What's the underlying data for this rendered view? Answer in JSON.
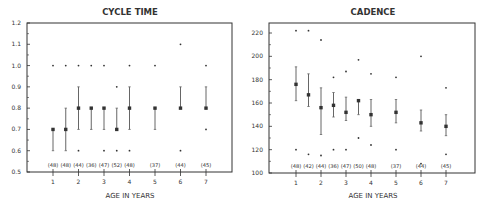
{
  "chart_data": [
    {
      "type": "scatter",
      "subtype": "error-bar",
      "title": "CYCLE TIME",
      "xlabel": "AGE IN YEARS",
      "ylabel": "",
      "ylim": [
        0.5,
        1.2
      ],
      "yticks": [
        0.5,
        0.6,
        0.7,
        0.8,
        0.9,
        1.0,
        1.1,
        1.2
      ],
      "ytick_labels": [
        "0.5",
        "0.6",
        "0.7",
        "0.8",
        "0.9",
        "1.0",
        "1.1",
        "1.2"
      ],
      "xticks": [
        1,
        2,
        3,
        4,
        5,
        6,
        7
      ],
      "grid": false,
      "points": [
        {
          "age": 1,
          "n": "(48)",
          "mean": 0.7,
          "low": 0.6,
          "high": 0.7,
          "outliers": [
            1.0
          ]
        },
        {
          "age": 1.5,
          "n": "(48)",
          "mean": 0.7,
          "low": 0.6,
          "high": 0.8,
          "outliers": [
            1.0
          ]
        },
        {
          "age": 2,
          "n": "(44)",
          "mean": 0.8,
          "low": 0.7,
          "high": 0.9,
          "outliers": [
            1.0,
            0.6
          ]
        },
        {
          "age": 2.5,
          "n": "(36)",
          "mean": 0.8,
          "low": 0.7,
          "high": 0.8,
          "outliers": [
            1.0
          ]
        },
        {
          "age": 3,
          "n": "(47)",
          "mean": 0.8,
          "low": 0.7,
          "high": 0.8,
          "outliers": [
            1.0,
            0.6
          ]
        },
        {
          "age": 3.5,
          "n": "(52)",
          "mean": 0.7,
          "low": 0.7,
          "high": 0.8,
          "outliers": [
            0.9,
            0.6
          ]
        },
        {
          "age": 4,
          "n": "(48)",
          "mean": 0.8,
          "low": 0.7,
          "high": 0.9,
          "outliers": [
            1.0,
            0.6
          ]
        },
        {
          "age": 5,
          "n": "(37)",
          "mean": 0.8,
          "low": 0.7,
          "high": 0.8,
          "outliers": [
            1.0
          ]
        },
        {
          "age": 6,
          "n": "(44)",
          "mean": 0.8,
          "low": 0.8,
          "high": 0.9,
          "outliers": [
            1.1,
            0.6
          ]
        },
        {
          "age": 7,
          "n": "(45)",
          "mean": 0.8,
          "low": 0.8,
          "high": 0.9,
          "outliers": [
            1.0,
            0.7
          ]
        }
      ]
    },
    {
      "type": "scatter",
      "subtype": "error-bar",
      "title": "CADENCE",
      "xlabel": "AGE IN YEARS",
      "ylabel": "",
      "ylim": [
        100,
        220
      ],
      "yticks": [
        100,
        120,
        140,
        160,
        180,
        200,
        220
      ],
      "ytick_labels": [
        "100",
        "120",
        "140",
        "160",
        "180",
        "200",
        "220"
      ],
      "xticks": [
        1,
        2,
        3,
        4,
        5,
        6,
        7
      ],
      "grid": false,
      "points": [
        {
          "age": 1,
          "n": "(48)",
          "mean": 176,
          "low": 162,
          "high": 191,
          "outliers": [
            222,
            120
          ]
        },
        {
          "age": 1.5,
          "n": "(42)",
          "mean": 167,
          "low": 157,
          "high": 185,
          "outliers": [
            222,
            116
          ]
        },
        {
          "age": 2,
          "n": "(44)",
          "mean": 156,
          "low": 133,
          "high": 173,
          "outliers": [
            214,
            115
          ]
        },
        {
          "age": 2.5,
          "n": "(36)",
          "mean": 158,
          "low": 148,
          "high": 169,
          "outliers": [
            182,
            120
          ]
        },
        {
          "age": 3,
          "n": "(47)",
          "mean": 152,
          "low": 145,
          "high": 165,
          "outliers": [
            187,
            120
          ]
        },
        {
          "age": 3.5,
          "n": "(50)",
          "mean": 162,
          "low": 150,
          "high": 163,
          "outliers": [
            197,
            130
          ]
        },
        {
          "age": 4,
          "n": "(48)",
          "mean": 150,
          "low": 140,
          "high": 163,
          "outliers": [
            185,
            124
          ]
        },
        {
          "age": 5,
          "n": "(37)",
          "mean": 152,
          "low": 143,
          "high": 163,
          "outliers": [
            182,
            120
          ]
        },
        {
          "age": 6,
          "n": "(44)",
          "mean": 143,
          "low": 136,
          "high": 154,
          "outliers": [
            200,
            108
          ]
        },
        {
          "age": 7,
          "n": "(45)",
          "mean": 140,
          "low": 132,
          "high": 150,
          "outliers": [
            173,
            116
          ]
        }
      ]
    }
  ],
  "layout": [
    {
      "frame": {
        "x0": 27,
        "x1": 232,
        "y0": 23,
        "y1": 172
      },
      "xpx": {
        "age1": 53,
        "step": 25.5
      },
      "title_x": 130
    },
    {
      "frame": {
        "x0": 269,
        "x1": 475,
        "y0": 23,
        "y1": 173
      },
      "xpx": {
        "age1": 296,
        "step": 25
      },
      "title_x": 373,
      "yaxis_top_px": 33
    }
  ],
  "colors": {
    "ink": "#333333",
    "bar": "#666666",
    "background": "#ffffff"
  }
}
